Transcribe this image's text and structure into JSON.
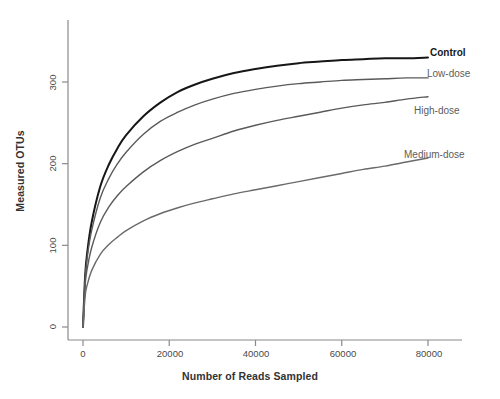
{
  "chart_data": {
    "type": "line",
    "title": "",
    "xlabel": "Number of Reads Sampled",
    "ylabel": "Measured OTUs",
    "xlim": [
      0,
      87000
    ],
    "ylim": [
      0,
      355
    ],
    "xticks": [
      0,
      20000,
      40000,
      60000,
      80000
    ],
    "xtick_labels": [
      "0",
      "20000",
      "40000",
      "60000",
      "80000"
    ],
    "yticks": [
      0,
      100,
      200,
      300
    ],
    "ytick_labels": [
      "0",
      "100",
      "200",
      "300"
    ],
    "grid": false,
    "legend_position": "right-inline-annotations",
    "x": [
      0,
      500,
      1000,
      2000,
      4000,
      6000,
      8000,
      10000,
      14000,
      18000,
      22000,
      26000,
      30000,
      35000,
      40000,
      45000,
      50000,
      55000,
      60000,
      65000,
      70000,
      75000,
      80000
    ],
    "series": [
      {
        "name": "Control",
        "label": "Control",
        "color": "#161616",
        "width": 2.0,
        "final_value": 330,
        "values": [
          0,
          63,
          92,
          128,
          172,
          199,
          219,
          235,
          258,
          275,
          288,
          297,
          304,
          311,
          316,
          320,
          323,
          325,
          327,
          328,
          329,
          329,
          330
        ]
      },
      {
        "name": "Low-dose",
        "label": "Low-dose",
        "color": "#5a5a5a",
        "width": 1.4,
        "final_value": 305,
        "values": [
          0,
          60,
          86,
          118,
          158,
          182,
          200,
          214,
          236,
          252,
          263,
          272,
          279,
          286,
          291,
          295,
          298,
          300,
          302,
          303,
          304,
          305,
          305
        ]
      },
      {
        "name": "High-dose",
        "label": "High-dose",
        "color": "#5a5a5a",
        "width": 1.4,
        "final_value": 282,
        "values": [
          0,
          52,
          72,
          97,
          128,
          147,
          161,
          172,
          190,
          204,
          215,
          224,
          231,
          240,
          247,
          253,
          258,
          263,
          268,
          272,
          275,
          279,
          282
        ]
      },
      {
        "name": "Medium-dose",
        "label": "Medium-dose",
        "color": "#6a6a6a",
        "width": 1.4,
        "final_value": 207,
        "values": [
          0,
          38,
          52,
          69,
          89,
          101,
          110,
          118,
          130,
          139,
          146,
          152,
          157,
          163,
          168,
          173,
          178,
          183,
          188,
          193,
          197,
          202,
          207
        ]
      }
    ],
    "annotations": [
      {
        "text": "Control",
        "x": 80000,
        "y": 330
      },
      {
        "text": "Low-dose",
        "x": 80000,
        "y": 305
      },
      {
        "text": "High-dose",
        "x": 80000,
        "y": 282
      },
      {
        "text": "Medium-dose",
        "x": 80000,
        "y": 207
      }
    ]
  },
  "axis": {
    "xlabel": "Number of Reads Sampled",
    "ylabel": "Measured OTUs"
  },
  "labels": {
    "control": "Control",
    "low_dose": "Low-dose",
    "high_dose": "High-dose",
    "medium_dose": "Medium-dose",
    "y0": "0",
    "y100": "100",
    "y200": "200",
    "y300": "300",
    "x0": "0",
    "x20000": "20000",
    "x40000": "40000",
    "x60000": "60000",
    "x80000": "80000"
  },
  "colors": {
    "background": "#ffffff",
    "axis": "#8a8a8a",
    "control_line": "#161616",
    "dose_line": "#5a5a5a",
    "text": "#3c3c3c"
  }
}
